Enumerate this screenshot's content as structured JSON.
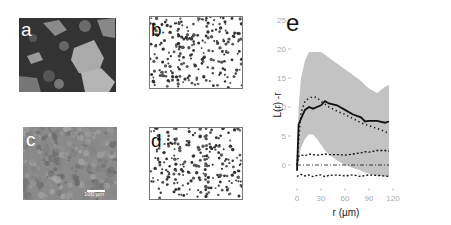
{
  "figure": {
    "panels": [
      {
        "id": "a",
        "label": "a",
        "kind": "micrograph",
        "description": "dark textured micrograph with light grain patches"
      },
      {
        "id": "b",
        "label": "b",
        "kind": "point-pattern",
        "description": "dark dots on white (segmented points)"
      },
      {
        "id": "c",
        "label": "c",
        "kind": "micrograph",
        "description": "grey mottled micrograph",
        "scale_bar": "100 µm"
      },
      {
        "id": "d",
        "label": "d",
        "kind": "point-pattern",
        "description": "dark dots on white (segmented points)"
      },
      {
        "id": "e",
        "label": "e",
        "kind": "chart"
      }
    ]
  },
  "chart_data": {
    "type": "line",
    "panel_label": "e",
    "title": "",
    "xlabel": "r (µm)",
    "ylabel": "L(r) -r",
    "xlim": [
      0,
      120
    ],
    "ylim": [
      -3,
      25
    ],
    "xticks": [
      0,
      30,
      60,
      90,
      120
    ],
    "yticks": [
      0,
      5,
      10,
      15,
      20,
      25
    ],
    "grid": false,
    "legend": null,
    "x": [
      0,
      2,
      5,
      10,
      15,
      20,
      25,
      30,
      35,
      40,
      50,
      60,
      70,
      80,
      85,
      90,
      100,
      110,
      115
    ],
    "series": [
      {
        "name": "observed L(r)-r (solid)",
        "style": "solid",
        "values": [
          -1,
          7,
          8,
          9.5,
          10,
          9.7,
          10,
          10.3,
          11,
          10.6,
          10.3,
          9.5,
          8.7,
          8.2,
          7.5,
          7.6,
          7.6,
          7.3,
          7.5
        ]
      },
      {
        "name": "dotted",
        "style": "dotted",
        "values": [
          0,
          4,
          9,
          11,
          11.5,
          11.8,
          11.6,
          11,
          10.5,
          10,
          9.3,
          8.7,
          8,
          7.3,
          7,
          6.8,
          6.3,
          5.8,
          5.3
        ]
      },
      {
        "name": "upper dashed",
        "style": "dashed",
        "values": [
          0,
          1.5,
          1.7,
          1.6,
          1.9,
          1.8,
          1.7,
          1.8,
          1.9,
          1.8,
          1.8,
          1.7,
          1.9,
          2.1,
          2.3,
          2.2,
          2.5,
          2.5,
          2.4
        ]
      },
      {
        "name": "zero line",
        "style": "dashdot",
        "values": [
          0,
          0,
          0,
          0,
          0,
          0,
          0,
          0,
          0,
          0,
          0,
          0,
          0,
          0,
          0,
          0,
          0,
          0,
          0
        ]
      },
      {
        "name": "lower dashed",
        "style": "dashed",
        "values": [
          -2,
          -1.8,
          -1.6,
          -1.9,
          -1.7,
          -2,
          -1.8,
          -1.7,
          -2,
          -1.8,
          -1.7,
          -1.9,
          -1.7,
          -2,
          -1.8,
          -1.7,
          -1.8,
          -1.9,
          -2
        ]
      }
    ],
    "envelopes": [
      {
        "name": "grey envelope upper",
        "values": [
          -1,
          10,
          15,
          18,
          19.5,
          19.5,
          19.5,
          19.5,
          19,
          18.5,
          17.5,
          16.5,
          15.5,
          14.5,
          13.8,
          13.2,
          12.4,
          13.5,
          13.8
        ]
      },
      {
        "name": "grey envelope lower",
        "values": [
          -1,
          0.5,
          3,
          4.5,
          5.3,
          5.2,
          4.5,
          3.5,
          2.5,
          1.8,
          0.8,
          0,
          -0.5,
          -1,
          -1.3,
          -1.5,
          -1.8,
          -2,
          -2
        ]
      }
    ]
  },
  "colors": {
    "envelope": "#c3c3c3",
    "line": "#111111",
    "tick_text": "#aaaaaa",
    "panel_border": "#777777"
  }
}
